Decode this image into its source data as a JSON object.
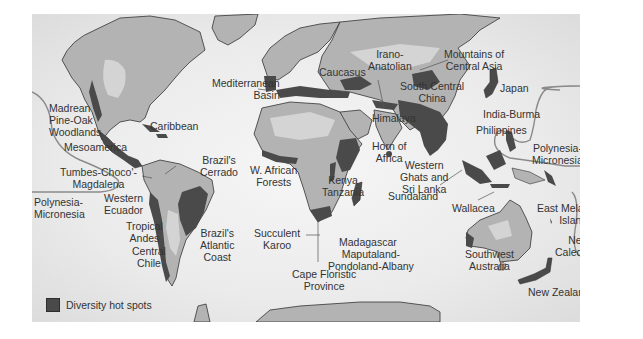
{
  "map": {
    "title": "Diversity hot spots world map",
    "colors": {
      "ocean": "#ececec",
      "land_light": "#d4d4d4",
      "land_mid": "#b3b3b3",
      "land_dark": "#9a9a9a",
      "hotspot": "#4a4a4a",
      "outline": "#333333",
      "boundary_line": "#8a8a8a"
    }
  },
  "legend": {
    "swatch_color": "#4a4a4a",
    "label": "Diversity hot spots"
  },
  "labels": {
    "madrean": "Madrean\nPine-Oak\nWoodlands",
    "caribbean": "Caribbean",
    "mesoamerica": "Mesoamerica",
    "tumbes": "Tumbes-Choco'-\nMagdalena",
    "polynesia_west": "Polynesia-\nMicronesia",
    "western_ecuador": "Western\nEcuador",
    "tropical_andes": "Tropical\nAndes",
    "central_chile": "Central\nChile",
    "brazil_cerrado": "Brazil's\nCerrado",
    "brazil_atlantic": "Brazil's\nAtlantic\nCoast",
    "mediterranean": "Mediterranean\nBasin",
    "caucasus": "Caucasus",
    "irano_anatolian": "Irano-\nAnatolian",
    "mountains_central_asia": "Mountains of\nCentral Asia",
    "south_central_china": "South Central\nChina",
    "himalaya": "Himalaya",
    "japan": "Japan",
    "india_burma": "India-Burma",
    "philippines": "Philippines",
    "horn_of_africa": "Horn of\nAfrica",
    "w_african_forests": "W. African\nForests",
    "kenya_tanzania": "Kenya\nTanzania",
    "western_ghats": "Western\nGhats and\nSri Lanka",
    "polynesia_east": "Polynesia-\nMicronesia",
    "succulent_karoo": "Succulent\nKaroo",
    "madagascar": "Madagascar",
    "maputaland": "Maputaland-\nPondoland-Albany",
    "cape_floristic": "Cape Floristic\nProvince",
    "sundaland": "Sundaland",
    "wallacea": "Wallacea",
    "east_melanesian": "East Melanesian\nIslands",
    "new_caledonia": "New\nCaledonia",
    "southwest_australia": "Southwest\nAustralia",
    "new_zealand": "New Zealand"
  }
}
